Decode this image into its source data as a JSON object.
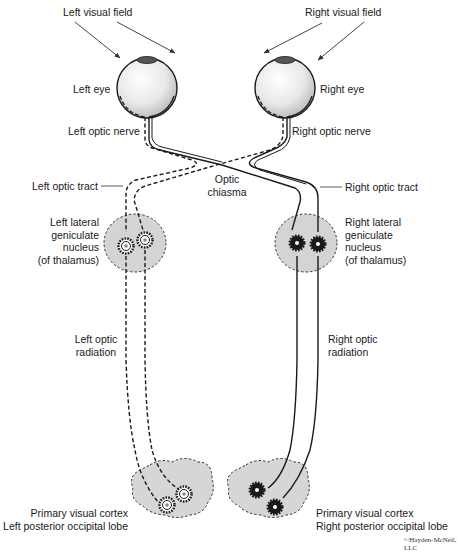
{
  "labels": {
    "left_visual_field": "Left visual field",
    "right_visual_field": "Right visual field",
    "left_eye": "Left eye",
    "right_eye": "Right eye",
    "left_optic_nerve": "Left optic nerve",
    "right_optic_nerve": "Right optic nerve",
    "optic_chiasma_line1": "Optic",
    "optic_chiasma_line2": "chiasma",
    "left_optic_tract": "Left optic tract",
    "right_optic_tract": "Right optic tract",
    "left_lgn": [
      "Left lateral",
      "geniculate",
      "nucleus",
      "(of thalamus)"
    ],
    "right_lgn": [
      "Right lateral",
      "geniculate",
      "nucleus",
      "(of thalamus)"
    ],
    "left_optic_radiation": [
      "Left optic",
      "radiation"
    ],
    "right_optic_radiation": [
      "Right optic",
      "radiation"
    ],
    "left_cortex": [
      "Primary visual cortex",
      "Left posterior occipital lobe"
    ],
    "right_cortex": [
      "Primary visual cortex",
      "Right posterior occipital lobe"
    ],
    "copyright": "©Hayden-McNeil, LLC"
  },
  "legend": {
    "left_field_pathway_style": "dashed",
    "right_field_pathway_style": "solid"
  },
  "colors": {
    "line": "#1a1a1a",
    "nucleus_fill": "#d4d4d4",
    "eye_fill": "#eeeeee",
    "cortex_fill": "#d6d6d6"
  }
}
